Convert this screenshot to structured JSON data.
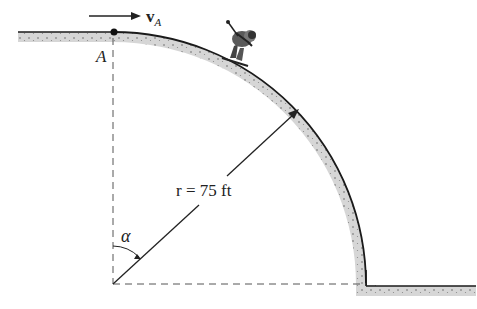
{
  "diagram": {
    "labels": {
      "point_a": "A",
      "velocity_symbol": "v",
      "velocity_subscript": "A",
      "radius_label": "r = 75 ft",
      "angle_label": "α"
    },
    "colors": {
      "surface_fill": "#d8d8d8",
      "edge": "#1a1a1a",
      "dashed": "#555555"
    },
    "icons": {
      "skier": "skier-figure"
    }
  }
}
